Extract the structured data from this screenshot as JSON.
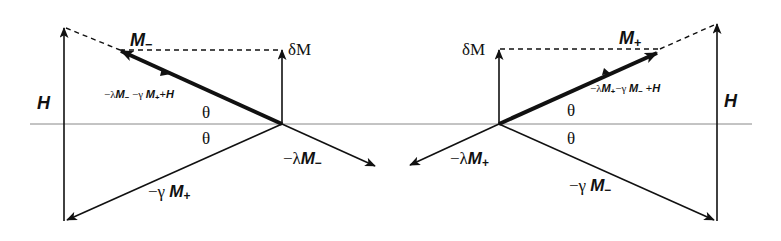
{
  "figure": {
    "type": "vector-diagram",
    "axis_color": "#888888",
    "line_color": "#111111"
  },
  "left": {
    "H_label": "H",
    "M_label": "M",
    "M_sub": "−",
    "deltaM_label": "δM",
    "resultant_label": {
      "part1": "−λ",
      "m1": "M",
      "s1": "−",
      "part2": " −γ ",
      "m2": "M",
      "s2": "+",
      "part3": "+",
      "h": "H"
    },
    "theta_upper": "θ",
    "theta_lower": "θ",
    "lambda_label": {
      "prefix": "−λ",
      "m": "M",
      "sub": "−"
    },
    "gamma_label": {
      "prefix": "−γ ",
      "m": "M",
      "sub": "+"
    }
  },
  "right": {
    "H_label": "H",
    "M_label": "M",
    "M_sub": "+",
    "deltaM_label": "δM",
    "resultant_label": {
      "part1": "−λ",
      "m1": "M",
      "s1": "+",
      "part2": "−γ ",
      "m2": "M",
      "s2": "−",
      "part3": " +",
      "h": "H"
    },
    "theta_upper": "θ",
    "theta_lower": "θ",
    "lambda_label": {
      "prefix": "−λ",
      "m": "M",
      "sub": "+"
    },
    "gamma_label": {
      "prefix": "−γ ",
      "m": "M",
      "sub": "−"
    }
  }
}
